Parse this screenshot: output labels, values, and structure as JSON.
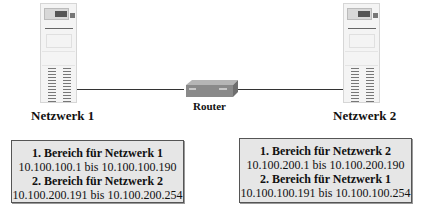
{
  "diagram": {
    "nodes": {
      "server_left": {
        "icon": "server-tower-icon"
      },
      "server_right": {
        "icon": "server-tower-icon"
      },
      "router": {
        "icon": "router-icon",
        "label": "Router"
      }
    },
    "network_labels": {
      "left": "Netzwerk 1",
      "right": "Netzwerk 2"
    },
    "boxes": [
      {
        "range1_title": "1. Bereich für Netzwerk 1",
        "range1_value": "10.100.100.1 bis 10.100.100.190",
        "range2_title": "2. Bereich für Netzwerk 2",
        "range2_value": "10.100.200.191 bis 10.100.200.254"
      },
      {
        "range1_title": "1. Bereich für Netzwerk 2",
        "range1_value": "10.100.200.1 bis 10.100.200.190",
        "range2_title": "2. Bereich für Netzwerk 1",
        "range2_value": "10.100.100.191 bis 10.100.100.254"
      }
    ],
    "colors": {
      "box_fill": "#e6e6e6",
      "router_fill": "#8a8a8a",
      "line": "#333333"
    }
  }
}
